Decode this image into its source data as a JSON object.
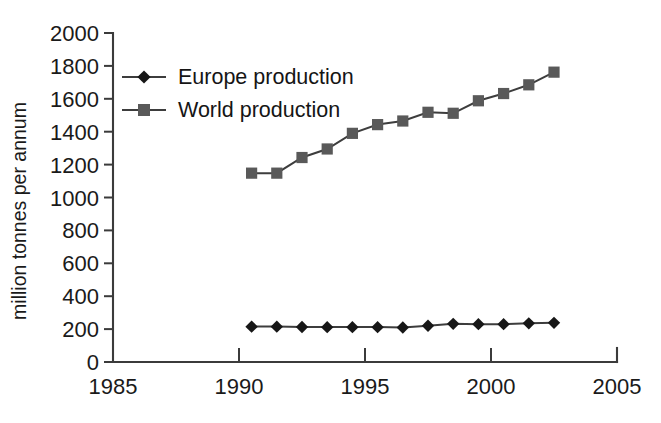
{
  "chart_data": {
    "type": "line",
    "title": "",
    "xlabel": "",
    "ylabel": "million tonnes per annum",
    "xlim": [
      1985,
      2005
    ],
    "ylim": [
      0,
      2000
    ],
    "xticks": [
      1985,
      1990,
      1995,
      2000,
      2005
    ],
    "xtick_labels": [
      "1985",
      "1990",
      "1995",
      "2000",
      "2005"
    ],
    "yticks": [
      0,
      200,
      400,
      600,
      800,
      1000,
      1200,
      1400,
      1600,
      1800,
      2000
    ],
    "ytick_labels": [
      "0",
      "200",
      "400",
      "600",
      "800",
      "1000",
      "1200",
      "1400",
      "1600",
      "1800",
      "2000"
    ],
    "grid": false,
    "legend_position": "upper left",
    "x": [
      1990.5,
      1991.5,
      1992.5,
      1993.5,
      1994.5,
      1995.5,
      1996.5,
      1997.5,
      1998.5,
      1999.5,
      2000.5,
      2001.5,
      2002.5
    ],
    "series": [
      {
        "name": "Europe production",
        "marker": "diamond",
        "color": "#171717",
        "values": [
          215,
          215,
          213,
          212,
          212,
          212,
          210,
          220,
          232,
          230,
          230,
          235,
          238
        ]
      },
      {
        "name": "World production",
        "marker": "square",
        "color": "#595959",
        "values": [
          1148,
          1148,
          1243,
          1295,
          1390,
          1443,
          1465,
          1518,
          1512,
          1588,
          1632,
          1685,
          1762
        ]
      }
    ]
  },
  "legend": {
    "entries": [
      {
        "label": "Europe production"
      },
      {
        "label": "World production"
      }
    ]
  },
  "axes": {
    "y_axis_title": "million tonnes per annum"
  },
  "colors": {
    "axis": "#3b3b3b",
    "europe": "#171717",
    "world": "#595959",
    "background": "#ffffff"
  }
}
